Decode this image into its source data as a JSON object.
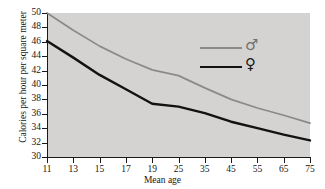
{
  "chart_data": {
    "type": "line",
    "title": "",
    "xlabel": "Mean age",
    "ylabel": "Calories per hour per square meter",
    "categories": [
      "11",
      "13",
      "15",
      "17",
      "19",
      "25",
      "35",
      "45",
      "55",
      "65",
      "75"
    ],
    "xticklabels": [
      "11",
      "13",
      "15",
      "17",
      "19",
      "25",
      "35",
      "45",
      "55",
      "65",
      "75"
    ],
    "yticklabels": [
      "50",
      "48",
      "46",
      "44",
      "42",
      "40",
      "38",
      "36",
      "34",
      "32",
      "30"
    ],
    "yticks": [
      50,
      48,
      46,
      44,
      42,
      40,
      38,
      36,
      34,
      32,
      30
    ],
    "ylim": [
      30,
      50
    ],
    "grid": false,
    "legend_position": "center-right",
    "series": [
      {
        "name": "male",
        "symbol": "♂",
        "color": "#8a8a8a",
        "values": [
          50.0,
          47.6,
          45.4,
          43.6,
          42.1,
          41.3,
          39.6,
          38.0,
          36.8,
          35.8,
          34.7
        ]
      },
      {
        "name": "female",
        "symbol": "♀",
        "color": "#121212",
        "values": [
          46.1,
          43.8,
          41.4,
          39.4,
          37.4,
          37.0,
          36.1,
          34.9,
          34.0,
          33.1,
          32.3
        ]
      }
    ]
  },
  "axes": {
    "ylabel": "Calories per hour per square meter",
    "xlabel": "Mean age"
  },
  "legend": {
    "items": [
      {
        "label": "♂",
        "name": "male",
        "color": "#8a8a8a"
      },
      {
        "label": "♀",
        "name": "female",
        "color": "#121212"
      }
    ]
  },
  "colors": {
    "panel_background": "#d4d3d1",
    "page_background": "#ffffff",
    "axis": "#1a1a1a",
    "male_line": "#8a8a8a",
    "female_line": "#121212"
  }
}
